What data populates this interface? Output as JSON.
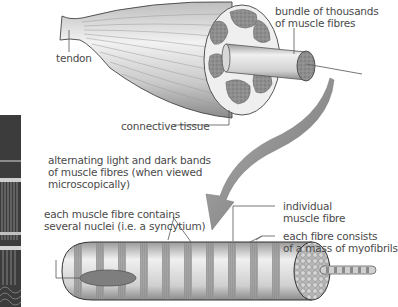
{
  "diagram": {
    "labels": {
      "tendon": "tendon",
      "bundle_line1": "bundle of thousands",
      "bundle_line2": "of muscle fibres",
      "connective": "connective tissue",
      "bands_line1": "alternating light and dark bands",
      "bands_line2": "of muscle fibres (when viewed",
      "bands_line3": "microscopically)",
      "nuclei_line1": "each muscle fibre contains",
      "nuclei_line2": "several nuclei (i.e. a syncytium)",
      "fibre_line1": "individual",
      "fibre_line2": "muscle fibre",
      "myofibrils_line1": "each fibre consists",
      "myofibrils_line2": "of a mass of myofibrils"
    },
    "colors": {
      "muscle_light": "#e6e6e6",
      "muscle_dark": "#9a9a9a",
      "bundle_fill": "#8c8c8c",
      "arrow": "#7a7a7a",
      "band_dark": "#8f8f8f",
      "band_light": "#d4d4d4",
      "leader_line": "#555555"
    },
    "micrograph": {
      "description": "striated muscle micrograph strip"
    }
  }
}
